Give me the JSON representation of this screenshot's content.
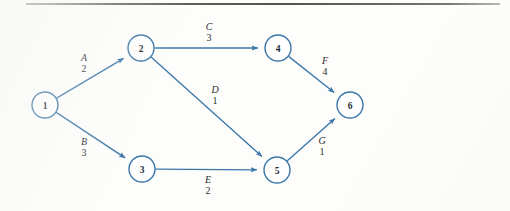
{
  "figure": {
    "kind": "activity-on-arc-network",
    "background_color": "#fdfdfc",
    "edge_color": "#3c77a8",
    "node_stroke_color": "#3c77a8",
    "node_fill_color": "#ffffff",
    "node_text_color": "#1d2a33",
    "label_text_color": "#2b2b2b",
    "rule_color": "#4a4a49"
  },
  "nodes": [
    {
      "id": "1",
      "label": "1",
      "cx": 45,
      "cy": 105,
      "r": 13
    },
    {
      "id": "2",
      "label": "2",
      "cx": 141,
      "cy": 48,
      "r": 13
    },
    {
      "id": "3",
      "label": "3",
      "cx": 142,
      "cy": 169,
      "r": 13
    },
    {
      "id": "4",
      "label": "4",
      "cx": 278,
      "cy": 48,
      "r": 13
    },
    {
      "id": "5",
      "label": "5",
      "cx": 277,
      "cy": 170,
      "r": 13
    },
    {
      "id": "6",
      "label": "6",
      "cx": 350,
      "cy": 105,
      "r": 13
    }
  ],
  "edges": [
    {
      "id": "A",
      "name": "A",
      "duration": "2",
      "from": "1",
      "to": "2",
      "label_x": 84,
      "label_y": 53
    },
    {
      "id": "B",
      "name": "B",
      "duration": "3",
      "from": "1",
      "to": "3",
      "label_x": 84,
      "label_y": 137
    },
    {
      "id": "C",
      "name": "C",
      "duration": "3",
      "from": "2",
      "to": "4",
      "label_x": 209,
      "label_y": 22
    },
    {
      "id": "D",
      "name": "D",
      "duration": "1",
      "from": "2",
      "to": "5",
      "label_x": 215,
      "label_y": 85
    },
    {
      "id": "E",
      "name": "E",
      "duration": "2",
      "from": "3",
      "to": "5",
      "label_x": 208,
      "label_y": 175
    },
    {
      "id": "F",
      "name": "F",
      "duration": "4",
      "from": "4",
      "to": "6",
      "label_x": 325,
      "label_y": 56
    },
    {
      "id": "G",
      "name": "G",
      "duration": "1",
      "from": "5",
      "to": "6",
      "label_x": 322,
      "label_y": 136
    }
  ],
  "chart_data": {
    "type": "diagram",
    "title": "",
    "nodes": [
      "1",
      "2",
      "3",
      "4",
      "5",
      "6"
    ],
    "edges": [
      {
        "activity": "A",
        "duration": 2,
        "from": 1,
        "to": 2
      },
      {
        "activity": "B",
        "duration": 3,
        "from": 1,
        "to": 3
      },
      {
        "activity": "C",
        "duration": 3,
        "from": 2,
        "to": 4
      },
      {
        "activity": "D",
        "duration": 1,
        "from": 2,
        "to": 5
      },
      {
        "activity": "E",
        "duration": 2,
        "from": 3,
        "to": 5
      },
      {
        "activity": "F",
        "duration": 4,
        "from": 4,
        "to": 6
      },
      {
        "activity": "G",
        "duration": 1,
        "from": 5,
        "to": 6
      }
    ]
  }
}
